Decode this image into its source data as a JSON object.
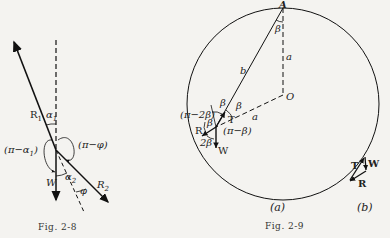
{
  "figures": [
    {
      "id": "fig-2-8",
      "caption": "Fig. 2-8",
      "labels": {
        "r1": "R",
        "r1_sub": "1",
        "alpha1": "α",
        "alpha1_sub": "1",
        "pi_minus_alpha1": "(π−α",
        "pi_minus_alpha1_sub": "1",
        "pi_minus_alpha1_close": ")",
        "pi_minus_phi": "(π−φ)",
        "w": "W",
        "alpha2": "α",
        "alpha2_sub": "2",
        "phi": "φ",
        "r2": "R",
        "r2_sub": "2"
      }
    },
    {
      "id": "fig-2-9",
      "caption": "Fig. 2-9",
      "sub_a": "(a)",
      "sub_b": "(b)",
      "labels": {
        "A": "A",
        "O": "O",
        "beta_top": "β",
        "a_vertical": "a",
        "b": "b",
        "a_horizontal": "a",
        "beta1": "β",
        "beta2": "β",
        "T": "T",
        "pi_minus_2beta": "(π−2β)",
        "beta3": "β",
        "R": "R",
        "pi_minus_beta": "(π−β)",
        "two_beta": "2β",
        "W": "W"
      },
      "triangle_labels": {
        "T": "T",
        "W": "W",
        "R": "R"
      }
    }
  ]
}
